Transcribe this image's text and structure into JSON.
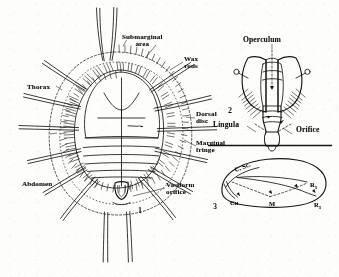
{
  "plate": {
    "background_color": "#fdfdfb",
    "ink_color": "#15120f",
    "subject": "whitefly pupal case and adult wing morphology"
  },
  "figure1": {
    "number": "1",
    "caption_labels": {
      "submarginal_area": "Submarginal\narea",
      "wax_rods": "Wax\nrods",
      "thorax": "Thorax",
      "abdomen": "Abdomen",
      "dorsal_disc": "Dorsal\ndisc",
      "marginal_fringe": "Marginal\nfringe",
      "vasiform_orifice": "Vasiform\norifice"
    }
  },
  "figure2": {
    "number": "2",
    "caption_labels": {
      "operculum": "Operculum",
      "lingula": "Lingula",
      "orifice": "Orifice"
    }
  },
  "figure3": {
    "number": "3",
    "vein_labels": {
      "costa_subcosta": "C. Sc.",
      "radius_five": "R",
      "radius_five_sub": "5",
      "radius_one": "R",
      "radius_one_sub": "1",
      "cubitus": "Cu",
      "cubitus_sub": "u",
      "media": "M"
    }
  }
}
